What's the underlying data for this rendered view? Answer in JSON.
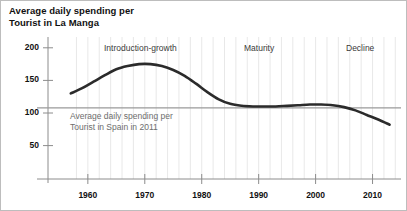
{
  "chart_data": {
    "type": "line",
    "title": "Average daily spending per\nTourist in La Manga",
    "xlabel": "",
    "ylabel": "",
    "xlim": [
      1953,
      2015
    ],
    "ylim": [
      0,
      215
    ],
    "grid": true,
    "grid_style": "faint vertical minor gridlines every 2 years",
    "legend": "none",
    "y_ticks": [
      50,
      100,
      150,
      200
    ],
    "y_tick_labels": [
      "50",
      "100",
      "150",
      "200"
    ],
    "x_ticks": [
      1960,
      1970,
      1980,
      1990,
      2000,
      2010
    ],
    "x_tick_labels": [
      "1960",
      "1970",
      "1980",
      "1990",
      "2000",
      "2010"
    ],
    "series": [
      {
        "name": "Average daily spending per Tourist in La Manga",
        "color": "#2b2b2b",
        "line_width": 2.6,
        "x": [
          1957,
          1959,
          1961,
          1963,
          1965,
          1967,
          1969,
          1971,
          1973,
          1975,
          1977,
          1979,
          1981,
          1983,
          1985,
          1987,
          1989,
          1991,
          1993,
          1995,
          1997,
          1999,
          2001,
          2003,
          2005,
          2007,
          2009,
          2011,
          2013
        ],
        "values": [
          130,
          138,
          148,
          158,
          167,
          172,
          175,
          175,
          172,
          166,
          157,
          145,
          132,
          121,
          114,
          111,
          110,
          110,
          110,
          111,
          112,
          113,
          113,
          112,
          109,
          104,
          97,
          90,
          82
        ]
      }
    ],
    "reference_line": {
      "label": "Average daily spending per\nTourist in Spain in 2011",
      "value": 108,
      "color": "#9a9a9a",
      "orientation": "horizontal"
    },
    "annotations": [
      {
        "text": "Introduction-growth",
        "x": 1963,
        "y": 200
      },
      {
        "text": "Maturity",
        "x": 1988,
        "y": 200
      },
      {
        "text": "Decline",
        "x": 2006,
        "y": 200
      }
    ]
  },
  "axes": {
    "axis_color": "#8c8c8c",
    "tick_color": "#8c8c8c",
    "gridline_color": "#dedede"
  }
}
